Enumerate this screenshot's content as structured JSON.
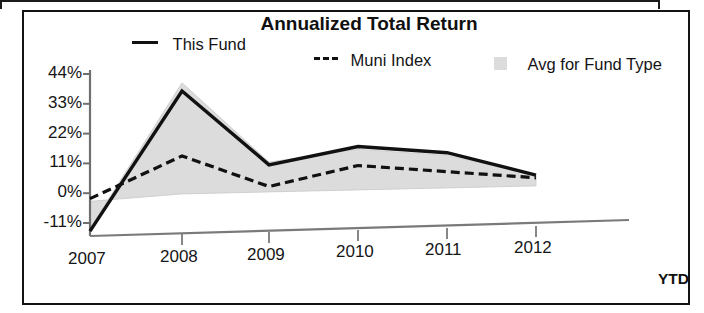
{
  "chart_data": {
    "type": "line",
    "title": "Annualized Total Return",
    "xlabel": "",
    "ylabel": "",
    "grid": false,
    "legend_position": "top",
    "categories": [
      "2007",
      "2008",
      "2009",
      "2010",
      "2011",
      "2012"
    ],
    "x_tick_suffix_label": "YTD",
    "y_tick_labels": [
      "44%",
      "33%",
      "22%",
      "11%",
      "0%",
      "-11%"
    ],
    "y_tick_values": [
      44,
      33,
      22,
      11,
      0,
      -11
    ],
    "ylim": [
      -14,
      44
    ],
    "series": [
      {
        "name": "This Fund",
        "style": "solid",
        "color": "#111111",
        "values": [
          -14,
          37,
          9,
          15,
          12,
          3
        ]
      },
      {
        "name": "Muni Index",
        "style": "dashed",
        "color": "#111111",
        "values": [
          -2,
          13,
          1,
          8,
          5,
          2
        ]
      },
      {
        "name": "Avg for Fund Type",
        "style": "filled-band",
        "color": "#dcdcdc",
        "upper_values": [
          -13,
          40,
          10,
          14,
          11,
          3
        ],
        "lower_values": [
          -3,
          -1,
          -1,
          -1,
          -1,
          -1
        ]
      }
    ]
  },
  "legend": {
    "this_fund": "This Fund",
    "muni_index": "Muni Index",
    "avg_for_fund_type": "Avg for Fund Type"
  },
  "icons": {
    "this_fund_swatch": "solid-line-swatch-icon",
    "muni_index_swatch": "dashed-line-swatch-icon",
    "avg_fund_swatch": "gray-square-swatch-icon"
  }
}
